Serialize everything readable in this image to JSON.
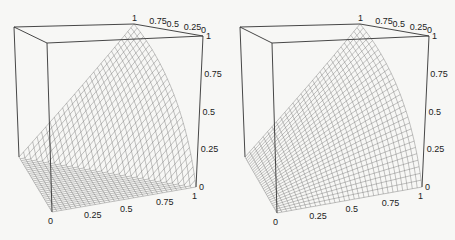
{
  "chart_data": [
    {
      "type": "surface",
      "title": "",
      "function": "max(x + y - 1, 0)",
      "xlabel": "",
      "ylabel": "",
      "zlabel": "",
      "x_ticks": [
        "0",
        "0.25",
        "0.5",
        "0.75",
        "1"
      ],
      "y_ticks": [
        "1",
        "0.75",
        "0.5",
        "0.25",
        "0"
      ],
      "z_ticks": [
        "0",
        "0.25",
        "0.5",
        "0.75",
        "1"
      ],
      "xlim": [
        0,
        1
      ],
      "ylim": [
        0,
        1
      ],
      "zlim": [
        0,
        1
      ],
      "grid_n": 30,
      "samples": {
        "x": [
          0,
          0.25,
          0.5,
          0.75,
          1
        ],
        "y": [
          0,
          0.25,
          0.5,
          0.75,
          1
        ],
        "z": [
          [
            0,
            0,
            0,
            0,
            0
          ],
          [
            0,
            0,
            0,
            0,
            0.25
          ],
          [
            0,
            0,
            0,
            0.25,
            0.5
          ],
          [
            0,
            0,
            0.25,
            0.5,
            0.75
          ],
          [
            0,
            0.25,
            0.5,
            0.75,
            1
          ]
        ]
      }
    },
    {
      "type": "surface",
      "title": "",
      "function": "x * y",
      "xlabel": "",
      "ylabel": "",
      "zlabel": "",
      "x_ticks": [
        "0",
        "0.25",
        "0.5",
        "0.75",
        "1"
      ],
      "y_ticks": [
        "1",
        "0.75",
        "0.5",
        "0.25",
        "0"
      ],
      "z_ticks": [
        "0",
        "0.25",
        "0.5",
        "0.75",
        "1"
      ],
      "xlim": [
        0,
        1
      ],
      "ylim": [
        0,
        1
      ],
      "zlim": [
        0,
        1
      ],
      "grid_n": 30,
      "samples": {
        "x": [
          0,
          0.25,
          0.5,
          0.75,
          1
        ],
        "y": [
          0,
          0.25,
          0.5,
          0.75,
          1
        ],
        "z": [
          [
            0,
            0,
            0,
            0,
            0
          ],
          [
            0,
            0.0625,
            0.125,
            0.1875,
            0.25
          ],
          [
            0,
            0.125,
            0.25,
            0.375,
            0.5
          ],
          [
            0,
            0.1875,
            0.375,
            0.5625,
            0.75
          ],
          [
            0,
            0.25,
            0.5,
            0.75,
            1
          ]
        ]
      }
    }
  ],
  "plots": [
    {
      "corners": {
        "x0y0z0": [
          52,
          212
        ],
        "x1y0z0": [
          196,
          187
        ],
        "x0y1z0": [
          19,
          157
        ],
        "x0y0z1": [
          47,
          43
        ],
        "x1y0z1": [
          203,
          36
        ],
        "x0y1z1": [
          14,
          27
        ],
        "x1y1z1": [
          134,
          24
        ]
      }
    },
    {
      "corners": {
        "x0y0z0": [
          277,
          213
        ],
        "x1y0z0": [
          422,
          187
        ],
        "x0y1z0": [
          245,
          157
        ],
        "x0y0z1": [
          272,
          43
        ],
        "x1y0z1": [
          429,
          36
        ],
        "x0y1z1": [
          240,
          27
        ],
        "x1y1z1": [
          360,
          24
        ]
      }
    }
  ]
}
